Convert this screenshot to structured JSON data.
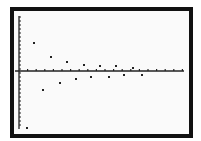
{
  "screen": {
    "type": "graphing-calculator-plot",
    "frame_color": "#111111",
    "background": "#fafafa",
    "point_color": "#222222"
  },
  "chart_data": {
    "type": "scatter",
    "title": "",
    "xlabel": "",
    "ylabel": "",
    "grid": false,
    "axes": {
      "x_axis_pixel_y": 71,
      "y_axis_pixel_x": 19
    },
    "x_tick_spacing_px": 8.6,
    "y_tick_spacing_px": 4,
    "points_px": [
      {
        "x": 27,
        "y": 128
      },
      {
        "x": 34,
        "y": 43
      },
      {
        "x": 43,
        "y": 90
      },
      {
        "x": 51,
        "y": 57
      },
      {
        "x": 60,
        "y": 83
      },
      {
        "x": 67,
        "y": 62
      },
      {
        "x": 76,
        "y": 79
      },
      {
        "x": 84,
        "y": 65
      },
      {
        "x": 91,
        "y": 77
      },
      {
        "x": 100,
        "y": 66
      },
      {
        "x": 109,
        "y": 77
      },
      {
        "x": 116,
        "y": 66
      },
      {
        "x": 124,
        "y": 75
      },
      {
        "x": 133,
        "y": 68
      },
      {
        "x": 142,
        "y": 75
      }
    ]
  }
}
